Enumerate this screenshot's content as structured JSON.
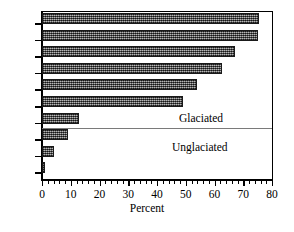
{
  "chart_data": {
    "type": "bar",
    "orientation": "horizontal",
    "title": "",
    "xlabel": "Percent",
    "ylabel": "",
    "categories": [
      "TL",
      "RA",
      "DF",
      "WF",
      "HF",
      "FL",
      "CH",
      "SB",
      "CP",
      "DK"
    ],
    "values": [
      75.5,
      75,
      67,
      62.5,
      54,
      49,
      13,
      9,
      4,
      1
    ],
    "xlim": [
      0,
      80
    ],
    "xticks": [
      0,
      10,
      20,
      30,
      40,
      50,
      60,
      70,
      80
    ],
    "xtick_labels": [
      "0",
      "10",
      "20",
      "30",
      "40",
      "50",
      "60",
      "70",
      "80"
    ],
    "minor_tick_interval": 2,
    "grid": false,
    "legend": "none",
    "bar_fill": "#6e6e6e",
    "bar_edge": "#1a1a1a",
    "annotations": [
      {
        "text": "Glaciated",
        "group_categories": [
          "TL",
          "RA",
          "DF",
          "WF",
          "HF",
          "FL"
        ]
      },
      {
        "text": "Unglaciated",
        "group_categories": [
          "CH",
          "SB",
          "CP",
          "DK"
        ]
      }
    ],
    "group_divider": true
  }
}
